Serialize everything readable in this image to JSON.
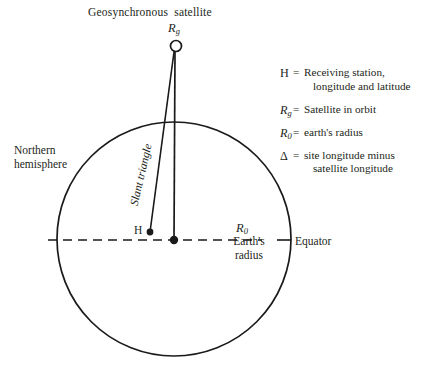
{
  "figure": {
    "title_caption": "Geosynchronous  satellite",
    "satellite_symbol": "R",
    "satellite_symbol_sub": "g",
    "northern_hemisphere_label_line1": "Northern",
    "northern_hemisphere_label_line2": "hemisphere",
    "slant_triangle_label": "Slant triangle",
    "h_point_label": "H",
    "earth_radius_symbol": "R",
    "earth_radius_symbol_sub": "0",
    "earth_radius_label_line1": "Earth's",
    "earth_radius_label_line2": "radius",
    "equator_label": "Equator"
  },
  "legend": {
    "items": [
      {
        "symbol": "H",
        "symbol_sub": "",
        "symbol_style": "upright",
        "equals": "=",
        "text_line1": "Receiving station,",
        "text_line2": "longitude and latitude"
      },
      {
        "symbol": "R",
        "symbol_sub": "g",
        "symbol_style": "italic",
        "equals": "=",
        "text_line1": "Satellite in orbit",
        "text_line2": ""
      },
      {
        "symbol": "R",
        "symbol_sub": "0",
        "symbol_style": "italic",
        "equals": "=",
        "text_line1": "earth's radius",
        "text_line2": ""
      },
      {
        "symbol": "Δ",
        "symbol_sub": "",
        "symbol_style": "upright",
        "equals": "=",
        "text_line1": "site longitude minus",
        "text_line2": "satellite longitude"
      }
    ]
  },
  "geometry": {
    "earth_circle": {
      "cx": 174,
      "cy": 239,
      "r": 117
    },
    "satellite_marker": {
      "cx": 176,
      "cy": 46,
      "r": 5.5
    },
    "center_dot": {
      "cx": 174,
      "cy": 240,
      "r": 4.2
    },
    "h_dot": {
      "cx": 150,
      "cy": 232,
      "r": 3.4
    },
    "equator_line": {
      "x1": 48,
      "y1": 240,
      "x2": 291,
      "y2": 240
    },
    "radius_line": {
      "x1": 291,
      "y1": 240,
      "x2": 274,
      "y2": 240
    },
    "vertical_line": {
      "x1": 175,
      "y1": 52,
      "x2": 174,
      "y2": 240
    },
    "slant_line": {
      "x1": 174,
      "y1": 52,
      "x2": 150,
      "y2": 232
    }
  },
  "colors": {
    "ink": "#231f20",
    "stroke": "#1a1a1a",
    "background": "#ffffff"
  }
}
